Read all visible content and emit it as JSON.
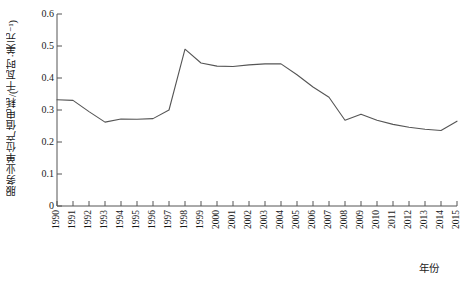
{
  "chart_data": {
    "type": "line",
    "title": "",
    "xlabel": "年份",
    "ylabel": "服务业单位产值电耗/(千瓦时·美元⁻¹)",
    "xlim": [
      1990,
      2015
    ],
    "ylim": [
      0,
      0.6
    ],
    "grid": false,
    "legend": null,
    "line_color": "#555555",
    "ytick_labels": [
      "0",
      "0.1",
      "0.2",
      "0.3",
      "0.4",
      "0.5",
      "0.6"
    ],
    "ytick_values": [
      0,
      0.1,
      0.2,
      0.3,
      0.4,
      0.5,
      0.6
    ],
    "categories": [
      "1990",
      "1991",
      "1992",
      "1993",
      "1994",
      "1995",
      "1996",
      "1997",
      "1998",
      "1999",
      "2000",
      "2001",
      "2002",
      "2003",
      "2004",
      "2005",
      "2006",
      "2007",
      "2008",
      "2009",
      "2010",
      "2011",
      "2012",
      "2013",
      "2014",
      "2015"
    ],
    "x": [
      1990,
      1991,
      1992,
      1993,
      1994,
      1995,
      1996,
      1997,
      1998,
      1999,
      2000,
      2001,
      2002,
      2003,
      2004,
      2005,
      2006,
      2007,
      2008,
      2009,
      2010,
      2011,
      2012,
      2013,
      2014,
      2015
    ],
    "values": [
      0.332,
      0.33,
      0.295,
      0.262,
      0.272,
      0.271,
      0.273,
      0.3,
      0.49,
      0.447,
      0.437,
      0.436,
      0.441,
      0.444,
      0.444,
      0.41,
      0.372,
      0.34,
      0.268,
      0.287,
      0.268,
      0.255,
      0.246,
      0.24,
      0.236,
      0.265
    ]
  }
}
